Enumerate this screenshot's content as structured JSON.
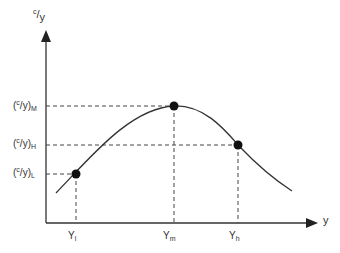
{
  "diagram": {
    "y_axis_label": {
      "num": "c",
      "den": "y"
    },
    "x_axis_label": "y",
    "y_ticks": [
      {
        "name": "cy-M",
        "num": "c",
        "den": "y",
        "sub": "M"
      },
      {
        "name": "cy-H",
        "num": "c",
        "den": "y",
        "sub": "H"
      },
      {
        "name": "cy-L",
        "num": "c",
        "den": "y",
        "sub": "L"
      }
    ],
    "x_ticks": [
      {
        "name": "Y-l",
        "base": "Y",
        "sub": "l"
      },
      {
        "name": "Y-m",
        "base": "Y",
        "sub": "m"
      },
      {
        "name": "Y-h",
        "base": "Y",
        "sub": "h"
      }
    ],
    "points": [
      {
        "label": "L",
        "x": "Yl",
        "y": "(c/y)L"
      },
      {
        "label": "M",
        "x": "Ym",
        "y": "(c/y)M"
      },
      {
        "label": "H",
        "x": "Yh",
        "y": "(c/y)H"
      }
    ],
    "colors": {
      "line": "#333333",
      "point": "#111111",
      "dashed": "#444444"
    }
  }
}
